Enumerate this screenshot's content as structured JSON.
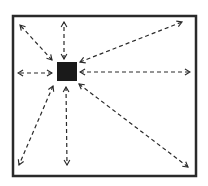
{
  "diagram": {
    "title": "",
    "type": "radial-dispersion",
    "colors": {
      "stroke": "#2a2a2a",
      "fill": "#1a1a1a",
      "background": "#ffffff"
    },
    "frame": {
      "x": 13,
      "y": 16,
      "width": 183,
      "height": 160
    },
    "source": {
      "x": 57,
      "y": 62,
      "width": 20,
      "height": 19
    },
    "arrows": [
      {
        "id": "top-left",
        "from": [
          52,
          60
        ],
        "to": [
          20,
          25
        ]
      },
      {
        "id": "top",
        "from": [
          64,
          59
        ],
        "to": [
          64,
          22
        ]
      },
      {
        "id": "top-right",
        "from": [
          80,
          62
        ],
        "to": [
          182,
          22
        ]
      },
      {
        "id": "left",
        "from": [
          52,
          73
        ],
        "to": [
          18,
          73
        ]
      },
      {
        "id": "right",
        "from": [
          80,
          72
        ],
        "to": [
          190,
          72
        ]
      },
      {
        "id": "bottom-left",
        "from": [
          53,
          86
        ],
        "to": [
          19,
          165
        ]
      },
      {
        "id": "bottom",
        "from": [
          66,
          87
        ],
        "to": [
          67,
          165
        ]
      },
      {
        "id": "bottom-right",
        "from": [
          79,
          84
        ],
        "to": [
          188,
          167
        ]
      }
    ]
  }
}
